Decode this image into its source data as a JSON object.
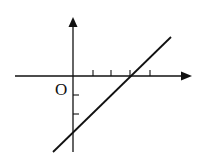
{
  "diagram": {
    "type": "linear-function-graph",
    "origin_label": "O",
    "x_axis": {
      "ticks_positive": 4,
      "arrow": true
    },
    "y_axis": {
      "ticks_negative": 2,
      "arrow": true
    },
    "line": {
      "description": "straight line with positive slope",
      "x_intercept_tick": 3,
      "y_intercept_tick": -3
    },
    "colors": {
      "ink": "#111111",
      "background": "#ffffff"
    }
  }
}
